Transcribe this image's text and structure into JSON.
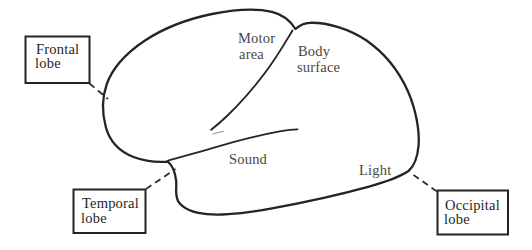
{
  "figure": {
    "background_color": "#ffffff",
    "ink_color": "#242424",
    "area_label_color": "#474747",
    "box_label_color": "#262626"
  },
  "brain_labels": {
    "motor_area": {
      "line1": "Motor",
      "line2": "area"
    },
    "body_surface": {
      "line1": "Body",
      "line2": "surface"
    },
    "sound": {
      "label": "Sound"
    },
    "light": {
      "label": "Light"
    }
  },
  "callout_boxes": {
    "frontal": {
      "line1": "Frontal",
      "line2": "lobe"
    },
    "temporal": {
      "line1": "Temporal",
      "line2": "lobe"
    },
    "occipital": {
      "line1": "Occipital",
      "line2": "lobe"
    }
  }
}
